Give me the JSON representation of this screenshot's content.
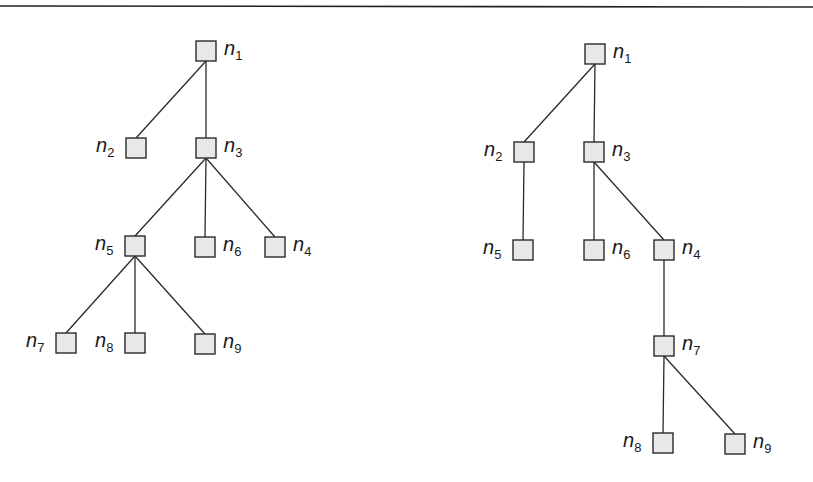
{
  "figure": {
    "top_rule": {
      "x1": 0,
      "y1": 6,
      "x2": 813,
      "y2": 7
    },
    "node_size": 20,
    "trees": [
      {
        "name": "tree-left",
        "nodes": [
          {
            "id": "n1",
            "base": "n",
            "sub": "1",
            "x": 206,
            "y": 51,
            "label_side": "right"
          },
          {
            "id": "n2",
            "base": "n",
            "sub": "2",
            "x": 136,
            "y": 148,
            "label_side": "left"
          },
          {
            "id": "n3",
            "base": "n",
            "sub": "3",
            "x": 206,
            "y": 148,
            "label_side": "right"
          },
          {
            "id": "n5",
            "base": "n",
            "sub": "5",
            "x": 135,
            "y": 246,
            "label_side": "left"
          },
          {
            "id": "n6",
            "base": "n",
            "sub": "6",
            "x": 205,
            "y": 247,
            "label_side": "right"
          },
          {
            "id": "n4",
            "base": "n",
            "sub": "4",
            "x": 275,
            "y": 247,
            "label_side": "right"
          },
          {
            "id": "n7",
            "base": "n",
            "sub": "7",
            "x": 66,
            "y": 343,
            "label_side": "left"
          },
          {
            "id": "n8",
            "base": "n",
            "sub": "8",
            "x": 135,
            "y": 343,
            "label_side": "left"
          },
          {
            "id": "n9",
            "base": "n",
            "sub": "9",
            "x": 205,
            "y": 344,
            "label_side": "right"
          }
        ],
        "edges": [
          [
            "n1",
            "n2"
          ],
          [
            "n1",
            "n3"
          ],
          [
            "n3",
            "n5"
          ],
          [
            "n3",
            "n6"
          ],
          [
            "n3",
            "n4"
          ],
          [
            "n5",
            "n7"
          ],
          [
            "n5",
            "n8"
          ],
          [
            "n5",
            "n9"
          ]
        ]
      },
      {
        "name": "tree-right",
        "nodes": [
          {
            "id": "n1",
            "base": "n",
            "sub": "1",
            "x": 595,
            "y": 54,
            "label_side": "right"
          },
          {
            "id": "n2",
            "base": "n",
            "sub": "2",
            "x": 524,
            "y": 152,
            "label_side": "left"
          },
          {
            "id": "n3",
            "base": "n",
            "sub": "3",
            "x": 594,
            "y": 152,
            "label_side": "right"
          },
          {
            "id": "n5",
            "base": "n",
            "sub": "5",
            "x": 523,
            "y": 250,
            "label_side": "left"
          },
          {
            "id": "n6",
            "base": "n",
            "sub": "6",
            "x": 594,
            "y": 250,
            "label_side": "right"
          },
          {
            "id": "n4",
            "base": "n",
            "sub": "4",
            "x": 664,
            "y": 250,
            "label_side": "right"
          },
          {
            "id": "n7",
            "base": "n",
            "sub": "7",
            "x": 664,
            "y": 346,
            "label_side": "right"
          },
          {
            "id": "n8",
            "base": "n",
            "sub": "8",
            "x": 663,
            "y": 443,
            "label_side": "left"
          },
          {
            "id": "n9",
            "base": "n",
            "sub": "9",
            "x": 735,
            "y": 444,
            "label_side": "right"
          }
        ],
        "edges": [
          [
            "n1",
            "n2"
          ],
          [
            "n1",
            "n3"
          ],
          [
            "n2",
            "n5"
          ],
          [
            "n3",
            "n6"
          ],
          [
            "n3",
            "n4"
          ],
          [
            "n4",
            "n7"
          ],
          [
            "n7",
            "n8"
          ],
          [
            "n7",
            "n9"
          ]
        ]
      }
    ]
  }
}
